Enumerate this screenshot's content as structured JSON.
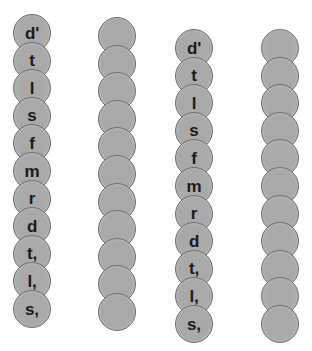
{
  "figure": {
    "bead_fill_color": "#a9a9a9",
    "bead_border_color": "#6f6f6f",
    "label_color": "#1b1b1b",
    "background_color": "#ffffff",
    "bead_diameter": 38,
    "bead_vertical_spacing": 27.6,
    "columns_count": 4,
    "beads_per_column": 11
  },
  "columns": [
    {
      "name": "column-1-labeled",
      "labeled": true,
      "center_x": 32,
      "top_y": 14,
      "labels": [
        "d'",
        "t",
        "l",
        "s",
        "f",
        "m",
        "r",
        "d",
        "t,",
        "l,",
        "s,"
      ]
    },
    {
      "name": "column-2-plain",
      "labeled": false,
      "center_x": 117,
      "top_y": 17,
      "labels": [
        "",
        "",
        "",
        "",
        "",
        "",
        "",
        "",
        "",
        "",
        ""
      ]
    },
    {
      "name": "column-3-labeled",
      "labeled": true,
      "center_x": 194,
      "top_y": 29,
      "labels": [
        "d'",
        "t",
        "l",
        "s",
        "f",
        "m",
        "r",
        "d",
        "t,",
        "l,",
        "s,"
      ]
    },
    {
      "name": "column-4-plain",
      "labeled": false,
      "center_x": 280,
      "top_y": 29,
      "labels": [
        "",
        "",
        "",
        "",
        "",
        "",
        "",
        "",
        "",
        "",
        ""
      ]
    }
  ]
}
